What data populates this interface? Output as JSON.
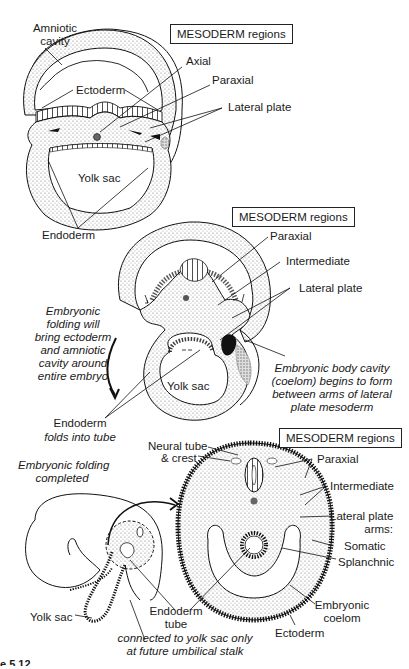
{
  "figure": {
    "panels": [
      {
        "id": "stage1",
        "box_title": "MESODERM regions",
        "labels": {
          "amniotic_cavity": "Amniotic\ncavity",
          "ectoderm": "Ectoderm",
          "axial": "Axial",
          "paraxial": "Paraxial",
          "lateral_plate": "Lateral plate",
          "yolk_sac": "Yolk sac",
          "endoderm": "Endoderm"
        }
      },
      {
        "id": "stage2",
        "box_title": "MESODERM regions",
        "labels": {
          "paraxial": "Paraxial",
          "intermediate": "Intermediate",
          "lateral_plate": "Lateral plate",
          "yolk_sac": "Yolk sac",
          "folding_note": "Embryonic\nfolding will\nbring ectoderm\nand amniotic\ncavity around\nentire embryo",
          "coelom_note": "Embryonic body cavity\n(coelom) begins to form\nbetween arms of lateral\nplate mesoderm",
          "endoderm_tube_note_1": "Endoderm",
          "endoderm_tube_note_2": "folds into tube"
        }
      },
      {
        "id": "stage3",
        "box_title": "MESODERM regions",
        "labels": {
          "neural_tube": "Neural tube",
          "crest": "& crest",
          "folding_completed": "Embryonic folding\ncompleted",
          "paraxial": "Paraxial",
          "intermediate": "Intermediate",
          "lateral_plate_arms": "Lateral plate\narms:",
          "somatic": "Somatic",
          "splanchnic": "Splanchnic",
          "embryonic_coelom": "Embryonic\ncoelom",
          "ectoderm": "Ectoderm",
          "endoderm_tube": "Endoderm\ntube",
          "yolk_sac": "Yolk sac",
          "connection_note": "connected to yolk sac only\nat future umbilical stalk"
        }
      }
    ],
    "caption_fragment": "e 5.12"
  }
}
